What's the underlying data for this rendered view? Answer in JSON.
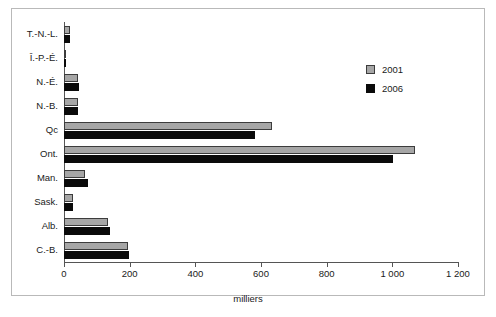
{
  "chart_data": {
    "type": "bar",
    "orientation": "horizontal",
    "title": "",
    "subtitle": "",
    "xlabel": "milliers",
    "ylabel": "",
    "categories": [
      "T.-N.-L.",
      "Î.-P.-É.",
      "N.-É.",
      "N.-B.",
      "Qc",
      "Ont.",
      "Man.",
      "Sask.",
      "Alb.",
      "C.-B."
    ],
    "series": [
      {
        "name": "2001",
        "color": "#a6a6a6",
        "values": [
          18,
          6,
          43,
          42,
          634,
          1070,
          64,
          27,
          134,
          195
        ]
      },
      {
        "name": "2006",
        "color": "#0a0a0a",
        "values": [
          17,
          5,
          45,
          44,
          582,
          1003,
          72,
          27,
          140,
          198
        ]
      }
    ],
    "xlim": [
      0,
      1200
    ],
    "x_ticks": [
      0,
      200,
      400,
      600,
      800,
      1000,
      1200
    ],
    "x_tick_labels": [
      "0",
      "200",
      "400",
      "600",
      "800",
      "1 000",
      "1 200"
    ],
    "grid": false,
    "legend_position": "inside-right-top",
    "legend_entries": [
      "2001",
      "2006"
    ]
  },
  "legend": {
    "items": [
      {
        "label": "2001"
      },
      {
        "label": "2006"
      }
    ]
  },
  "axis": {
    "x_title": "milliers"
  }
}
